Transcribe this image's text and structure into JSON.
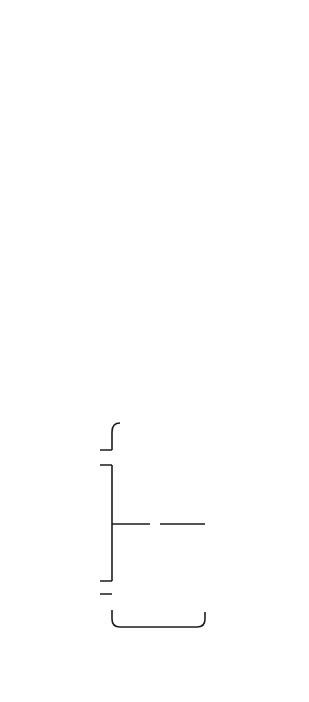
{
  "figure": {
    "caption": "FIG. 6.8"
  },
  "schematic": {
    "labels": {
      "vent": "Vent",
      "valve_left": "Valve",
      "pump_left": "Pump",
      "sputtering_target_line1": "Sputtering",
      "sputtering_target_line2": "Target",
      "condensation_line1": "Condensation",
      "condensation_line2": "Chamber",
      "gas_supply": "Gas Supply",
      "nozzle": "Nozzle",
      "substrate": "Substrate",
      "valve_right": "Valve",
      "pump_right": "Pump",
      "deposition_line1": "Deposition",
      "deposition_line2": "Chamber"
    }
  },
  "process": {
    "temperature_arrow": "Temperature Decreases",
    "pressure_arrow": "Pressure Decreases",
    "regions": {
      "source": "Source",
      "condensation": "Condensation chamber",
      "deposition": "Deposition chamber"
    },
    "labels": {
      "insb_target": "InSb Target",
      "plasma_region": "Plasma Region",
      "insb_atoms": "InSb atoms",
      "ar_gas_top": "Ar gas",
      "ar_gas_bottom": "Ar gas",
      "insb_clusters_bottom": "InSb clusters",
      "insb_clusters_top": "InSb clusters",
      "nozzle": "Nozzle",
      "plate": "Plate",
      "substrate": "Substrate",
      "nanoparticles_line1": "InSb",
      "nanoparticles_line2": "nanoparticles",
      "nanoparticles_line3": "on substrate"
    }
  },
  "colors": {
    "arrow_gradient_start": "#d9d9d9",
    "arrow_gradient_end": "#9a9a9a",
    "particle": "#8a8a8a",
    "line": "#222222"
  }
}
